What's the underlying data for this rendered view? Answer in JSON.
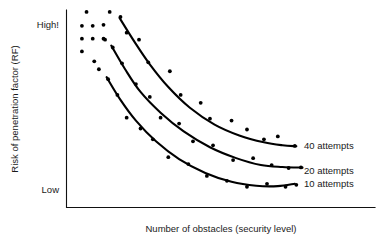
{
  "chart_data": {
    "type": "scatter",
    "title": "",
    "xlabel": "Number of obstacles (security level)",
    "ylabel": "Risk of penetration factor (RF)",
    "grid": false,
    "legend_position": "right-inline-end-of-curve",
    "ytick_labels": [
      "High!",
      "Low"
    ],
    "xtick_labels": [],
    "xlim": [
      0,
      100
    ],
    "ylim": [
      0,
      100
    ],
    "axis_style": "open-left-bottom-spines",
    "series": [
      {
        "name": "40 attempts",
        "label": "40 attempts",
        "label_x": 77,
        "label_y": 31,
        "curve": [
          [
            17.2,
            96.0
          ],
          [
            22.0,
            84.0
          ],
          [
            27.0,
            72.5
          ],
          [
            33.0,
            61.0
          ],
          [
            40.0,
            50.5
          ],
          [
            48.0,
            42.0
          ],
          [
            56.0,
            36.5
          ],
          [
            64.0,
            33.0
          ],
          [
            70.0,
            31.5
          ],
          [
            74.5,
            31.0
          ]
        ],
        "points": [
          [
            14.0,
            99.0
          ],
          [
            17.5,
            96.5
          ],
          [
            19.5,
            88.5
          ],
          [
            23.5,
            85.0
          ],
          [
            26.5,
            73.5
          ],
          [
            33.5,
            69.0
          ],
          [
            37.0,
            57.0
          ],
          [
            43.5,
            53.0
          ],
          [
            46.5,
            45.0
          ],
          [
            53.5,
            44.0
          ],
          [
            58.5,
            39.5
          ],
          [
            64.0,
            34.5
          ],
          [
            68.5,
            36.0
          ],
          [
            74.0,
            31.2
          ]
        ]
      },
      {
        "name": "20 attempts",
        "label": "20 attempts",
        "label_x": 77,
        "label_y": 18.5,
        "curve": [
          [
            14.5,
            82.0
          ],
          [
            19.0,
            70.0
          ],
          [
            24.0,
            58.5
          ],
          [
            30.5,
            48.0
          ],
          [
            38.0,
            38.5
          ],
          [
            46.5,
            30.5
          ],
          [
            55.0,
            25.0
          ],
          [
            63.0,
            21.5
          ],
          [
            70.0,
            20.5
          ],
          [
            76.5,
            20.2
          ]
        ],
        "points": [
          [
            12.0,
            85.5
          ],
          [
            15.0,
            81.0
          ],
          [
            18.0,
            73.0
          ],
          [
            22.5,
            62.5
          ],
          [
            27.0,
            56.0
          ],
          [
            30.5,
            45.5
          ],
          [
            36.5,
            42.5
          ],
          [
            41.0,
            33.5
          ],
          [
            47.5,
            31.5
          ],
          [
            54.0,
            24.0
          ],
          [
            60.5,
            25.0
          ],
          [
            66.5,
            21.5
          ],
          [
            72.0,
            20.0
          ],
          [
            76.0,
            20.3
          ]
        ]
      },
      {
        "name": "10 attempts",
        "label": "10 attempts",
        "label_x": 77,
        "label_y": 12.0,
        "curve": [
          [
            13.0,
            66.0
          ],
          [
            17.5,
            54.5
          ],
          [
            22.5,
            44.0
          ],
          [
            29.0,
            33.5
          ],
          [
            36.5,
            24.5
          ],
          [
            45.0,
            17.5
          ],
          [
            53.5,
            13.0
          ],
          [
            61.5,
            11.0
          ],
          [
            68.5,
            10.8
          ],
          [
            74.0,
            12.0
          ]
        ],
        "points": [
          [
            10.5,
            70.0
          ],
          [
            13.5,
            65.0
          ],
          [
            16.5,
            57.0
          ],
          [
            19.5,
            45.5
          ],
          [
            24.0,
            40.0
          ],
          [
            28.0,
            34.5
          ],
          [
            33.0,
            25.5
          ],
          [
            39.5,
            22.0
          ],
          [
            45.5,
            16.0
          ],
          [
            52.0,
            13.5
          ],
          [
            58.5,
            10.5
          ],
          [
            65.0,
            12.0
          ],
          [
            71.0,
            10.5
          ],
          [
            74.5,
            11.5
          ]
        ]
      }
    ],
    "cluster_points": [
      [
        6.5,
        99.0
      ],
      [
        5.0,
        92.0
      ],
      [
        8.5,
        92.0
      ],
      [
        12.0,
        92.5
      ],
      [
        5.0,
        85.5
      ],
      [
        8.5,
        85.5
      ],
      [
        12.5,
        85.0
      ],
      [
        5.0,
        79.0
      ],
      [
        9.0,
        74.0
      ]
    ]
  },
  "axes": {
    "y_top_label": "High!",
    "y_bottom_label": "Low",
    "y_title": "Risk of penetration factor (RF)",
    "x_title": "Number of obstacles (security level)"
  },
  "colors": {
    "ink": "#000000",
    "text": "#1a1a1a",
    "background": "#ffffff"
  }
}
